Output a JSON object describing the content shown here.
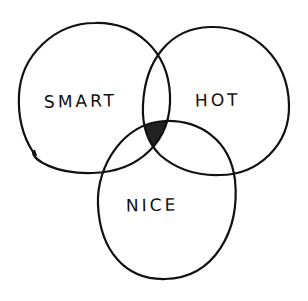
{
  "diagram": {
    "type": "venn",
    "style": "hand-drawn",
    "colors": {
      "background": "#ffffff",
      "stroke": "#111111",
      "intersection_fill": "#222222"
    },
    "sets": [
      {
        "id": "smart",
        "label": "SMART"
      },
      {
        "id": "hot",
        "label": "HOT"
      },
      {
        "id": "nice",
        "label": "NICE"
      }
    ],
    "highlighted_region": {
      "sets": [
        "smart",
        "hot",
        "nice"
      ],
      "description": "center intersection filled"
    }
  }
}
